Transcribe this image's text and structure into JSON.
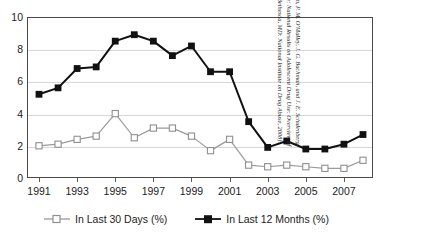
{
  "chart_data": {
    "type": "line",
    "title": "",
    "xlabel": "",
    "ylabel": "",
    "ylim": [
      0,
      10
    ],
    "yticks": [
      0,
      2,
      4,
      6,
      8,
      10
    ],
    "grid": true,
    "legend_position": "bottom",
    "x": [
      1991,
      1992,
      1993,
      1994,
      1995,
      1996,
      1997,
      1998,
      1999,
      2000,
      2001,
      2002,
      2003,
      2004,
      2005,
      2006,
      2007,
      2008
    ],
    "xtick_labels": [
      "1991",
      "1993",
      "1995",
      "1997",
      "1999",
      "2001",
      "2003",
      "2005",
      "2007"
    ],
    "xtick_values": [
      1991,
      1993,
      1995,
      1997,
      1999,
      2001,
      2003,
      2005,
      2007
    ],
    "series": [
      {
        "name": "In Last 30 Days (%)",
        "marker": "open-square",
        "color": "#9a9a9a",
        "values": [
          2.0,
          2.1,
          2.4,
          2.6,
          4.0,
          2.5,
          3.1,
          3.1,
          2.6,
          1.7,
          2.4,
          0.8,
          0.7,
          0.8,
          0.7,
          0.6,
          0.6,
          1.1
        ]
      },
      {
        "name": "In Last 12 Months (%)",
        "marker": "filled-square",
        "color": "#111111",
        "values": [
          5.2,
          5.6,
          6.8,
          6.9,
          8.5,
          8.9,
          8.5,
          7.6,
          8.2,
          6.6,
          6.6,
          3.5,
          1.9,
          2.3,
          1.8,
          1.8,
          2.1,
          2.7
        ]
      }
    ],
    "source_note": "Source: L. D. Johnston, P. M. O'Malley, J. G. Bachman, and J. E. Schulenberg, Monitoring the Future: National Results on Adolescent Drug Use: Overview of Key Findings, 2008 (Bethesda, MD: National Institute on Drug Abuse, 2008)."
  }
}
